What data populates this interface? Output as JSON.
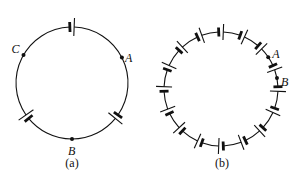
{
  "figure": {
    "panels": [
      {
        "id": "a",
        "caption": "(a)",
        "center": [
          72,
          83
        ],
        "radius": 56,
        "battery_count": 3,
        "battery_angles_deg": [
          -90,
          143,
          37
        ],
        "points": [
          {
            "label": "A",
            "angle_deg": -27
          },
          {
            "label": "B",
            "angle_deg": 90
          },
          {
            "label": "C",
            "angle_deg": -150
          }
        ]
      },
      {
        "id": "b",
        "caption": "(b)",
        "center": [
          221,
          89
        ],
        "radius": 57,
        "battery_count": 16,
        "points": [
          {
            "label": "A",
            "angle_deg": -34
          },
          {
            "label": "B",
            "angle_deg": -11
          }
        ]
      }
    ],
    "colors": {
      "line": "#111111",
      "background": "#ffffff"
    }
  }
}
